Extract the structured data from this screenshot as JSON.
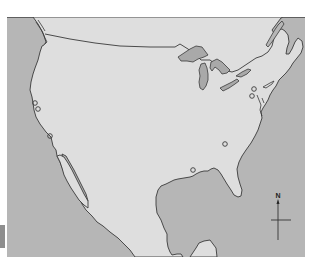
{
  "map": {
    "title": "",
    "region": "North America (USA, southern Canada, Mexico)",
    "colors": {
      "water": "#b6b6b6",
      "land": "#dedede",
      "outline": "#3a3a3a",
      "lakes": "#a9a9a9",
      "edge_tab": "#8e8e8e"
    },
    "compass": {
      "label": "N"
    },
    "markers": [
      {
        "id": "marker-sf-1",
        "x": 35,
        "y": 103
      },
      {
        "id": "marker-sf-2",
        "x": 38,
        "y": 109
      },
      {
        "id": "marker-la",
        "x": 50,
        "y": 136
      },
      {
        "id": "marker-ny-1",
        "x": 254,
        "y": 89
      },
      {
        "id": "marker-ny-2",
        "x": 252,
        "y": 96
      },
      {
        "id": "marker-atlanta",
        "x": 225,
        "y": 144
      },
      {
        "id": "marker-new-orleans",
        "x": 193,
        "y": 170
      }
    ]
  }
}
